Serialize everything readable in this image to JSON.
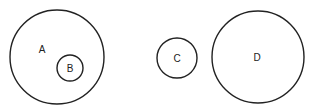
{
  "diagram": {
    "type": "set-circles",
    "circles": [
      {
        "id": "A",
        "label": "A",
        "cx": 57,
        "cy": 57,
        "r": 47,
        "label_x": 42,
        "label_y": 53
      },
      {
        "id": "B",
        "label": "B",
        "cx": 70,
        "cy": 68,
        "r": 13,
        "label_x": 70,
        "label_y": 72,
        "contained_in": "A"
      },
      {
        "id": "C",
        "label": "C",
        "cx": 177,
        "cy": 58,
        "r": 20,
        "label_x": 177,
        "label_y": 62
      },
      {
        "id": "D",
        "label": "D",
        "cx": 258,
        "cy": 57,
        "r": 46,
        "label_x": 257,
        "label_y": 61
      }
    ]
  }
}
